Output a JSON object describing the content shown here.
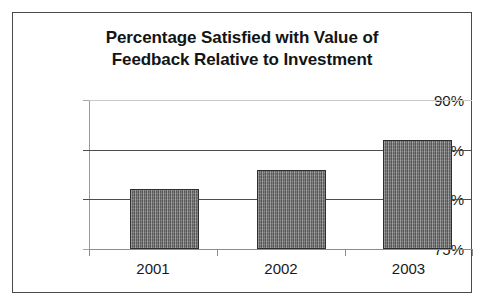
{
  "chart_data": {
    "type": "bar",
    "title": "Percentage Satisfied with Value of Feedback Relative to Investment",
    "title_lines": [
      "Percentage Satisfied with Value of",
      "Feedback Relative to Investment"
    ],
    "categories": [
      "2001",
      "2002",
      "2003"
    ],
    "values": [
      81,
      83,
      86
    ],
    "value_labels": [
      "81%",
      "83%",
      "86%"
    ],
    "xlabel": "",
    "ylabel": "",
    "ylim": [
      75,
      90
    ],
    "yticks": [
      75,
      80,
      85,
      90
    ],
    "ytick_labels": [
      "75%",
      "80%",
      "85%",
      "90%"
    ],
    "grid": true,
    "legend": false,
    "series": [
      {
        "name": "Percentage Satisfied",
        "values": [
          81,
          83,
          86
        ],
        "color": "#6f6f6f",
        "border_color": "#2e2e2e",
        "pattern": "vertical-hatch-gray"
      }
    ],
    "colors": {
      "background": "#ffffff",
      "frame_border": "#4a4a4a",
      "gridline": "#4d4d4d",
      "gridline_faint": "#c9c9c9",
      "axis": "#8d8d8d",
      "text": "#1a1a1a",
      "title_text": "#141414"
    }
  }
}
